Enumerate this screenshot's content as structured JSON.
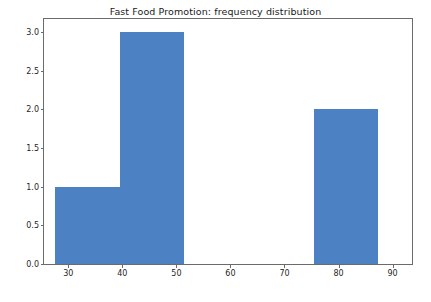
{
  "chart_data": {
    "type": "bar",
    "title": "Fast Food Promotion: frequency distribution",
    "xlabel": "",
    "ylabel": "",
    "categories": [
      "27.6-39.6",
      "39.6-51.5",
      "51.5-63.5",
      "63.5-75.4",
      "75.4-87.4"
    ],
    "bin_edges": [
      27.6,
      39.6,
      51.5,
      63.5,
      75.4,
      87.4
    ],
    "values": [
      1,
      3,
      0,
      0,
      2
    ],
    "bars": [
      {
        "label": "27.6-39.6",
        "x0": 27.6,
        "x1": 39.6,
        "value": 1
      },
      {
        "label": "39.6-51.5",
        "x0": 39.6,
        "x1": 51.5,
        "value": 3
      },
      {
        "label": "51.5-63.5",
        "x0": 51.5,
        "x1": 63.5,
        "value": 0
      },
      {
        "label": "63.5-75.4",
        "x0": 63.5,
        "x1": 75.4,
        "value": 0
      },
      {
        "label": "75.4-87.4",
        "x0": 75.4,
        "x1": 87.4,
        "value": 2
      }
    ],
    "xlim": [
      25.5,
      93.6
    ],
    "ylim": [
      0,
      3.17
    ],
    "xticks": [
      30,
      40,
      50,
      60,
      70,
      80,
      90
    ],
    "xtick_labels": [
      "30",
      "40",
      "50",
      "60",
      "70",
      "80",
      "90"
    ],
    "yticks": [
      0.0,
      0.5,
      1.0,
      1.5,
      2.0,
      2.5,
      3.0
    ],
    "ytick_labels": [
      "0.0",
      "0.5",
      "1.0",
      "1.5",
      "2.0",
      "2.5",
      "3.0"
    ],
    "grid": false,
    "legend": null,
    "bar_color": "#4c81c4",
    "axes_color": "#6b6b6b",
    "background_color": "#ffffff"
  }
}
